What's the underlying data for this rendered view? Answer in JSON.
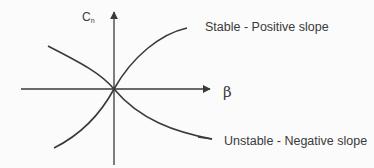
{
  "diagram": {
    "axes": {
      "y_label_main": "C",
      "y_label_sub": "n",
      "x_label": "β"
    },
    "curves": [
      {
        "name": "stable",
        "label": "Stable - Positive slope",
        "slope": "positive"
      },
      {
        "name": "unstable",
        "label": "Unstable - Negative slope",
        "slope": "negative"
      }
    ],
    "colors": {
      "background": "#fbfbfb",
      "line": "#3a3a3a",
      "text": "#3a3a3a"
    }
  }
}
